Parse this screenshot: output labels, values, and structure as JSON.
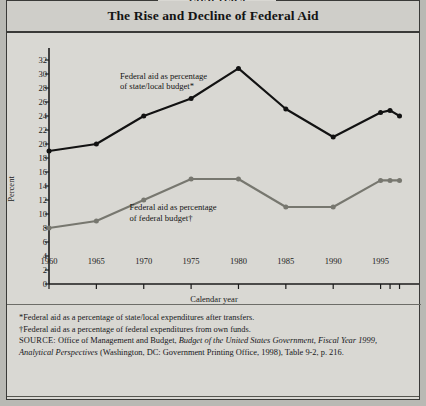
{
  "figure": {
    "chapter_tab": "CHAPTER 9",
    "title": "The Rise and Decline of Federal Aid"
  },
  "chart_data": {
    "type": "line",
    "title": "The Rise and Decline of Federal Aid",
    "xlabel": "Calendar year",
    "ylabel": "Percent",
    "xlim": [
      1960,
      1998
    ],
    "ylim": [
      0,
      32
    ],
    "ytick_step": 2,
    "yticks": [
      0,
      2,
      4,
      6,
      8,
      10,
      12,
      14,
      16,
      18,
      20,
      22,
      24,
      26,
      28,
      30,
      32
    ],
    "xticks": [
      1960,
      1965,
      1970,
      1975,
      1980,
      1985,
      1990,
      1995,
      1996,
      1997
    ],
    "xtick_labels": [
      "1960",
      "1965",
      "1970",
      "1975",
      "1980",
      "1985",
      "1990",
      "1995",
      "",
      ""
    ],
    "grid": false,
    "legend_position": "inline-annotation",
    "x": [
      1960,
      1965,
      1970,
      1975,
      1980,
      1985,
      1990,
      1995,
      1996,
      1997
    ],
    "series": [
      {
        "name": "Federal aid as percentage of state/local budget*",
        "color": "#121212",
        "values": [
          19,
          20,
          24,
          26.5,
          30.8,
          25,
          21,
          24.5,
          24.8,
          24
        ]
      },
      {
        "name": "Federal aid as percentage of federal budget†",
        "color": "#77776f",
        "values": [
          8,
          9,
          12,
          15,
          15,
          11,
          11,
          14.8,
          14.8,
          14.8
        ]
      }
    ],
    "annotations": [
      {
        "name": "state-local-series-label",
        "line1": "Federal aid as percentage",
        "line2": "of state/local budget*"
      },
      {
        "name": "federal-budget-series-label",
        "line1": "Federal aid as percentage",
        "line2": "of federal budget†"
      }
    ]
  },
  "notes": {
    "footnote_star": "*Federal aid as a percentage of state/local expenditures after transfers.",
    "footnote_dagger": "†Federal aid as a percentage of federal expenditures from own funds.",
    "source_label": "SOURCE:",
    "source_text_1": " Office of Management and Budget, ",
    "source_italic_1": "Budget of the United States Government, Fiscal Year 1999, Analytical Perspectives",
    "source_text_2": " (Washington, DC: Government Printing Office, 1998), Table 9-2, p. 216."
  }
}
